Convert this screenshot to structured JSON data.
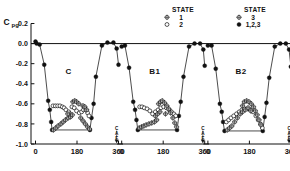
{
  "chart_data": {
    "type": "scatter",
    "title": "",
    "xlabel": "",
    "ylabel": "Cpg",
    "ylabel_base": "C",
    "ylabel_sub": "pg",
    "ylim": [
      -1.0,
      0.2
    ],
    "ytick_labels": [
      "0.2",
      "0.0",
      "-0.2",
      "-0.4",
      "-0.6",
      "-0.8",
      "-1.0"
    ],
    "ytick_values": [
      0.2,
      0.0,
      -0.2,
      -0.4,
      -0.6,
      -0.8,
      -1.0
    ],
    "xlim": [
      0,
      360
    ],
    "xtick_labels": [
      "0",
      "180",
      "360"
    ],
    "xtick_values": [
      0,
      180,
      360
    ],
    "grid": false,
    "legend_position": "top",
    "legends": [
      {
        "title": "STATE",
        "entries": [
          {
            "marker": "crossed-circle",
            "label": "1"
          },
          {
            "marker": "open-circle",
            "label": "2"
          }
        ]
      },
      {
        "title": "STATE",
        "entries": [
          {
            "marker": "crossed-circle",
            "label": "3"
          },
          {
            "marker": "filled-circle",
            "label": "1,2,3"
          }
        ]
      }
    ],
    "panels": [
      {
        "label": "C",
        "annotation": {
          "lines": [
            "C",
            "A",
            "F"
          ],
          "x": 352,
          "arrow": true
        },
        "series": [
          {
            "name": "1,2,3",
            "marker": "filled-circle",
            "connected": true,
            "points": [
              [
                0,
                0.02
              ],
              [
                5,
                0.0
              ],
              [
                18,
                -0.01
              ],
              [
                38,
                -0.21
              ],
              [
                55,
                -0.57
              ],
              [
                62,
                -0.66
              ],
              [
                68,
                -0.78
              ],
              [
                72,
                -0.86
              ],
              [
                236,
                -0.86
              ],
              [
                243,
                -0.74
              ],
              [
                252,
                -0.6
              ],
              [
                262,
                -0.33
              ],
              [
                288,
                -0.02
              ],
              [
                312,
                0.01
              ],
              [
                338,
                0.01
              ],
              [
                352,
                -0.05
              ],
              [
                360,
                -0.21
              ]
            ]
          },
          {
            "name": "2",
            "marker": "open-circle",
            "connected": false,
            "points": [
              [
                76,
                -0.62
              ],
              [
                86,
                -0.62
              ],
              [
                96,
                -0.62
              ],
              [
                106,
                -0.62
              ],
              [
                116,
                -0.63
              ],
              [
                124,
                -0.64
              ],
              [
                132,
                -0.66
              ],
              [
                144,
                -0.68
              ],
              [
                158,
                -0.63
              ],
              [
                168,
                -0.64
              ],
              [
                178,
                -0.67
              ],
              [
                190,
                -0.69
              ],
              [
                200,
                -0.68
              ],
              [
                208,
                -0.66
              ],
              [
                218,
                -0.66
              ],
              [
                226,
                -0.69
              ],
              [
                232,
                -0.72
              ]
            ]
          },
          {
            "name": "1",
            "marker": "crossed-circle",
            "connected": false,
            "points": [
              [
                78,
                -0.86
              ],
              [
                88,
                -0.84
              ],
              [
                98,
                -0.82
              ],
              [
                110,
                -0.8
              ],
              [
                120,
                -0.78
              ],
              [
                130,
                -0.76
              ],
              [
                142,
                -0.74
              ],
              [
                152,
                -0.73
              ],
              [
                162,
                -0.58
              ],
              [
                170,
                -0.57
              ],
              [
                178,
                -0.58
              ],
              [
                188,
                -0.6
              ],
              [
                150,
                -0.7
              ],
              [
                160,
                -0.71
              ],
              [
                196,
                -0.74
              ],
              [
                206,
                -0.77
              ],
              [
                216,
                -0.8
              ],
              [
                226,
                -0.83
              ],
              [
                234,
                -0.85
              ],
              [
                140,
                -0.7
              ],
              [
                206,
                -0.62
              ],
              [
                214,
                -0.63
              ],
              [
                222,
                -0.66
              ]
            ]
          }
        ]
      },
      {
        "label": "B1",
        "annotation": {
          "lines": [
            "C",
            "A",
            "F"
          ],
          "x": 352,
          "arrow": true
        },
        "series": [
          {
            "name": "1,2,3",
            "marker": "filled-circle",
            "connected": true,
            "points": [
              [
                0,
                -0.03
              ],
              [
                14,
                -0.02
              ],
              [
                32,
                -0.24
              ],
              [
                50,
                -0.58
              ],
              [
                58,
                -0.66
              ],
              [
                64,
                -0.76
              ],
              [
                70,
                -0.86
              ],
              [
                240,
                -0.86
              ],
              [
                248,
                -0.72
              ],
              [
                256,
                -0.58
              ],
              [
                268,
                -0.33
              ],
              [
                292,
                -0.03
              ],
              [
                316,
                0.0
              ],
              [
                340,
                0.0
              ],
              [
                354,
                -0.06
              ],
              [
                360,
                -0.22
              ]
            ]
          },
          {
            "name": "2",
            "marker": "open-circle",
            "connected": false,
            "points": [
              [
                78,
                -0.63
              ],
              [
                88,
                -0.63
              ],
              [
                98,
                -0.64
              ],
              [
                110,
                -0.65
              ],
              [
                122,
                -0.67
              ],
              [
                134,
                -0.7
              ],
              [
                146,
                -0.68
              ],
              [
                158,
                -0.66
              ],
              [
                170,
                -0.64
              ],
              [
                182,
                -0.63
              ],
              [
                194,
                -0.64
              ],
              [
                206,
                -0.66
              ],
              [
                216,
                -0.68
              ],
              [
                226,
                -0.7
              ],
              [
                234,
                -0.72
              ]
            ]
          },
          {
            "name": "1",
            "marker": "crossed-circle",
            "connected": false,
            "points": [
              [
                76,
                -0.84
              ],
              [
                86,
                -0.83
              ],
              [
                96,
                -0.82
              ],
              [
                106,
                -0.81
              ],
              [
                118,
                -0.8
              ],
              [
                130,
                -0.79
              ],
              [
                142,
                -0.78
              ],
              [
                152,
                -0.76
              ],
              [
                160,
                -0.6
              ],
              [
                168,
                -0.58
              ],
              [
                176,
                -0.57
              ],
              [
                186,
                -0.59
              ],
              [
                196,
                -0.62
              ],
              [
                204,
                -0.65
              ],
              [
                212,
                -0.69
              ],
              [
                222,
                -0.74
              ],
              [
                230,
                -0.79
              ],
              [
                238,
                -0.83
              ],
              [
                146,
                -0.72
              ],
              [
                156,
                -0.7
              ],
              [
                166,
                -0.68
              ],
              [
                190,
                -0.7
              ]
            ]
          }
        ]
      },
      {
        "label": "B2",
        "annotation": {
          "lines": [
            "C",
            "A",
            "F"
          ],
          "x": 352,
          "arrow": true
        },
        "series": [
          {
            "name": "1,2,3",
            "marker": "filled-circle",
            "connected": true,
            "points": [
              [
                0,
                -0.02
              ],
              [
                16,
                -0.02
              ],
              [
                34,
                -0.25
              ],
              [
                52,
                -0.6
              ],
              [
                60,
                -0.68
              ],
              [
                66,
                -0.78
              ],
              [
                72,
                -0.87
              ],
              [
                238,
                -0.87
              ],
              [
                246,
                -0.73
              ],
              [
                254,
                -0.59
              ],
              [
                266,
                -0.34
              ],
              [
                290,
                -0.03
              ],
              [
                314,
                0.0
              ],
              [
                338,
                0.0
              ],
              [
                352,
                -0.06
              ],
              [
                360,
                -0.23
              ]
            ]
          },
          {
            "name": "2",
            "marker": "open-circle",
            "connected": false,
            "points": [
              [
                80,
                -0.78
              ],
              [
                90,
                -0.76
              ],
              [
                100,
                -0.74
              ],
              [
                112,
                -0.72
              ],
              [
                124,
                -0.7
              ],
              [
                136,
                -0.68
              ],
              [
                148,
                -0.66
              ],
              [
                160,
                -0.65
              ],
              [
                172,
                -0.65
              ],
              [
                184,
                -0.66
              ],
              [
                196,
                -0.68
              ],
              [
                208,
                -0.72
              ],
              [
                218,
                -0.76
              ],
              [
                228,
                -0.8
              ],
              [
                236,
                -0.84
              ]
            ]
          },
          {
            "name": "3",
            "marker": "crossed-circle",
            "connected": false,
            "points": [
              [
                84,
                -0.86
              ],
              [
                94,
                -0.84
              ],
              [
                104,
                -0.82
              ],
              [
                116,
                -0.78
              ],
              [
                128,
                -0.74
              ],
              [
                140,
                -0.7
              ],
              [
                150,
                -0.62
              ],
              [
                158,
                -0.58
              ],
              [
                168,
                -0.57
              ],
              [
                178,
                -0.58
              ],
              [
                188,
                -0.6
              ],
              [
                198,
                -0.63
              ],
              [
                206,
                -0.67
              ],
              [
                214,
                -0.71
              ],
              [
                222,
                -0.76
              ],
              [
                230,
                -0.81
              ],
              [
                150,
                -0.68
              ],
              [
                162,
                -0.66
              ],
              [
                174,
                -0.64
              ],
              [
                186,
                -0.67
              ]
            ]
          }
        ]
      }
    ]
  }
}
